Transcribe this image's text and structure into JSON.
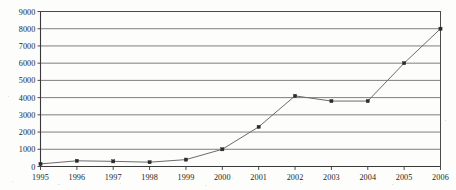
{
  "chart_data": {
    "type": "line",
    "title": "",
    "subtitle": "",
    "xlabel": "",
    "ylabel": "",
    "categories": [
      "1995",
      "1996",
      "1997",
      "1998",
      "1999",
      "2000",
      "2001",
      "2002",
      "2003",
      "2004",
      "2005",
      "2006"
    ],
    "values": [
      150,
      330,
      300,
      250,
      400,
      1000,
      2300,
      4100,
      3800,
      3800,
      6000,
      8000
    ],
    "series": [
      {
        "name": "",
        "values": [
          150,
          330,
          300,
          250,
          400,
          1000,
          2300,
          4100,
          3800,
          3800,
          6000,
          8000
        ]
      }
    ],
    "ylim": [
      0,
      9000
    ],
    "y_ticks": [
      0,
      1000,
      2000,
      3000,
      4000,
      5000,
      6000,
      7000,
      8000,
      9000
    ],
    "y_tick_labels": [
      "0",
      "1000",
      "2000",
      "3000",
      "4000",
      "5000",
      "6000",
      "7000",
      "8000",
      "9000"
    ],
    "x_tick_labels": [
      "1995",
      "1996",
      "1997",
      "1998",
      "1999",
      "2000",
      "2001",
      "2002",
      "2003",
      "2004",
      "2005",
      "2006"
    ],
    "grid": "horizontal",
    "legend": "none",
    "marker": "square",
    "colors": {
      "line": "#6b6b6b",
      "marker": "#2b2b2b",
      "grid": "#6f6f6f",
      "axis": "#3a3a3a",
      "background": "#fdfdfc",
      "text": "#1d1d1d"
    }
  }
}
